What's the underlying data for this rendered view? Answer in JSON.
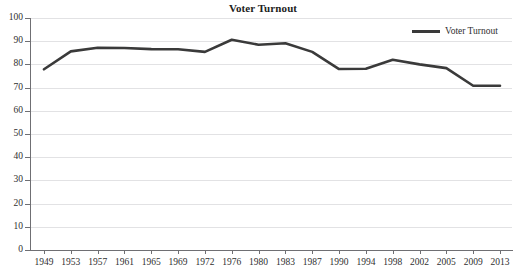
{
  "chart_data": {
    "type": "line",
    "title": "Voter Turnout",
    "xlabel": "",
    "ylabel": "",
    "ylim": [
      0,
      100
    ],
    "ytick_step": 10,
    "yticks": [
      0,
      10,
      20,
      30,
      40,
      50,
      60,
      70,
      80,
      90,
      100
    ],
    "grid": true,
    "grid_axis": "y",
    "legend_position": "top-right",
    "categories": [
      "1949",
      "1953",
      "1957",
      "1961",
      "1965",
      "1969",
      "1972",
      "1976",
      "1980",
      "1983",
      "1987",
      "1990",
      "1994",
      "1998",
      "2002",
      "2005",
      "2009",
      "2013"
    ],
    "series": [
      {
        "name": "Voter Turnout",
        "color": "#3a3a3a",
        "values": [
          77.9,
          85.6,
          87.2,
          87.1,
          86.6,
          86.5,
          85.4,
          90.6,
          88.5,
          89.1,
          85.4,
          78.0,
          78.1,
          82.0,
          80.0,
          78.4,
          70.8,
          70.8
        ]
      }
    ]
  },
  "legend": {
    "entries": [
      {
        "label": "Voter Turnout",
        "color": "#3a3a3a"
      }
    ]
  }
}
